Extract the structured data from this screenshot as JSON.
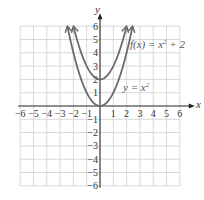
{
  "chart_data": {
    "type": "line",
    "title": "",
    "xlabel": "x",
    "ylabel": "y",
    "xlim": [
      -6,
      6
    ],
    "ylim": [
      -6,
      6
    ],
    "grid": true,
    "x_ticks": [
      "-6",
      "-5",
      "-4",
      "-3",
      "-2",
      "-1",
      "1",
      "2",
      "3",
      "4",
      "5",
      "6"
    ],
    "y_ticks": [
      "6",
      "5",
      "4",
      "3",
      "2",
      "1",
      "-1",
      "-2",
      "-3",
      "-4",
      "-5",
      "-6"
    ],
    "series": [
      {
        "name": "y = x²",
        "label_text": "y = x",
        "label_sup": "2",
        "formula": "x^2",
        "x": [
          -2.45,
          -2,
          -1,
          0,
          1,
          2,
          2.45
        ],
        "values": [
          6,
          4,
          1,
          0,
          1,
          4,
          6
        ],
        "color": "#6a6a6a"
      },
      {
        "name": "f(x) = x² + 2",
        "label_text": "f(x) = x",
        "label_sup": "2",
        "label_tail": " + 2",
        "formula": "x^2+2",
        "x": [
          -2,
          -1,
          0,
          1,
          2
        ],
        "values": [
          6,
          3,
          2,
          3,
          6
        ],
        "color": "#6a6a6a"
      }
    ],
    "annotations": [
      "f(x) = x² + 2",
      "y = x²"
    ]
  },
  "colors": {
    "grid": "#cfcfcf",
    "axis": "#222222",
    "curve": "#6a6a6a"
  }
}
